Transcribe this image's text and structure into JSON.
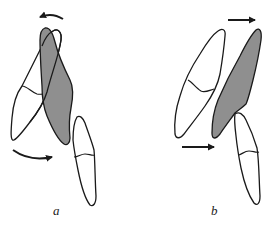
{
  "figure": {
    "panels": [
      {
        "id": "a",
        "label": "a",
        "description": "Upper incisor (shaded) tipping/rotating relative to adjacent tooth; curved arrows indicate rotation",
        "arrows": [
          {
            "position": "top",
            "type": "curved",
            "direction": "left"
          },
          {
            "position": "bottom-left",
            "type": "curved",
            "direction": "right"
          }
        ]
      },
      {
        "id": "b",
        "label": "b",
        "description": "Upper incisor (shaded) translated bodily forward; straight arrows indicate translation",
        "arrows": [
          {
            "position": "top",
            "type": "straight",
            "direction": "right"
          },
          {
            "position": "bottom-left",
            "type": "straight",
            "direction": "right"
          }
        ]
      }
    ],
    "colors": {
      "outline": "#1a1a1a",
      "shaded_tooth": "#8f8f8f",
      "background": "#ffffff",
      "tooth_fill": "#ffffff"
    }
  }
}
